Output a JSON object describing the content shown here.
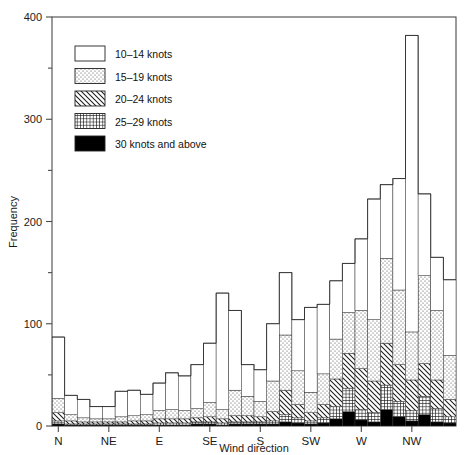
{
  "chart_data": {
    "type": "bar",
    "title": "",
    "xlabel": "Wind direction",
    "ylabel": "Frequency",
    "ylim": [
      0,
      400
    ],
    "yticks": [
      0,
      100,
      200,
      300,
      400
    ],
    "yticks_minor": [
      50,
      150,
      250,
      350
    ],
    "grid": false,
    "stacked": true,
    "legend_position": "top-left",
    "xtick_labels": [
      "N",
      "NE",
      "E",
      "SE",
      "S",
      "SW",
      "W",
      "NW"
    ],
    "xtick_positions_deg": [
      0,
      45,
      90,
      135,
      180,
      225,
      270,
      315
    ],
    "bin_width_deg": 11.25,
    "n_bins": 32,
    "series": [
      {
        "name": "10–14 knots",
        "pattern": "white",
        "color": "#ffffff",
        "values": [
          60,
          19,
          18,
          12,
          12,
          25,
          25,
          20,
          27,
          36,
          34,
          43,
          58,
          114,
          78,
          31,
          31,
          56,
          61,
          50,
          83,
          68,
          57,
          48,
          70,
          118,
          72,
          109,
          290,
          80,
          52,
          74
        ]
      },
      {
        "name": "15–19 knots",
        "pattern": "dotted",
        "color": "#efefef",
        "values": [
          14,
          6,
          4,
          3,
          3,
          5,
          5,
          6,
          8,
          9,
          8,
          9,
          14,
          9,
          25,
          19,
          15,
          30,
          54,
          33,
          20,
          30,
          39,
          40,
          57,
          60,
          83,
          73,
          47,
          86,
          68,
          43
        ]
      },
      {
        "name": "20–24 knots",
        "pattern": "diagonal",
        "color": "#d8d8d8",
        "values": [
          8,
          3,
          2,
          2,
          2,
          2,
          3,
          3,
          4,
          4,
          4,
          4,
          5,
          4,
          6,
          6,
          5,
          9,
          24,
          13,
          8,
          13,
          27,
          34,
          40,
          31,
          41,
          36,
          30,
          32,
          28,
          17
        ]
      },
      {
        "name": "25–29 knots",
        "pattern": "crosshatch",
        "color": "#b5b5b5",
        "values": [
          3,
          1,
          1,
          1,
          1,
          1,
          1,
          1,
          2,
          2,
          2,
          2,
          2,
          2,
          2,
          2,
          2,
          3,
          7,
          5,
          3,
          5,
          12,
          23,
          10,
          9,
          24,
          15,
          10,
          18,
          13,
          6
        ]
      },
      {
        "name": "30 knots and above",
        "pattern": "black",
        "color": "#000000",
        "values": [
          2,
          1,
          1,
          1,
          1,
          1,
          1,
          1,
          1,
          1,
          1,
          2,
          2,
          1,
          2,
          2,
          2,
          2,
          4,
          3,
          2,
          3,
          7,
          14,
          6,
          4,
          16,
          9,
          5,
          11,
          4,
          3
        ]
      }
    ]
  },
  "legend": {
    "items": [
      {
        "label": "10–14 knots"
      },
      {
        "label": "15–19 knots"
      },
      {
        "label": "20–24 knots"
      },
      {
        "label": "25–29 knots"
      },
      {
        "label": "30 knots and above"
      }
    ]
  },
  "axes": {
    "y_title": "Frequency",
    "x_title": "Wind direction",
    "y_tick_labels": [
      "0",
      "100",
      "200",
      "300",
      "400"
    ],
    "x_tick_labels": [
      "N",
      "NE",
      "E",
      "SE",
      "S",
      "SW",
      "W",
      "NW"
    ]
  }
}
